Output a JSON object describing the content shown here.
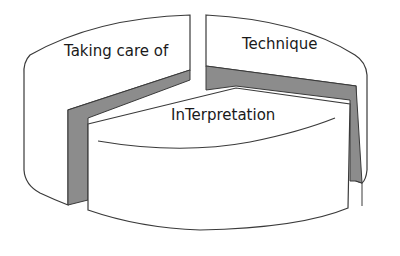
{
  "diagram": {
    "type": "3d-exploded-pie",
    "segments": [
      {
        "id": "taking-care-of",
        "label": "Taking care of"
      },
      {
        "id": "technique",
        "label": "Technique"
      },
      {
        "id": "interpretation",
        "label": "InTerpretation"
      }
    ],
    "colors": {
      "face": "#ffffff",
      "outline": "#3a3a3a",
      "side_wall": "#8c8c8c"
    }
  }
}
